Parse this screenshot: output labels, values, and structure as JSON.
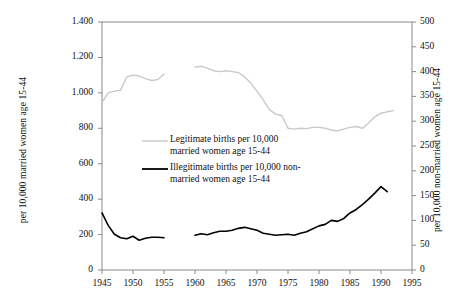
{
  "chart_data": {
    "type": "line",
    "title": "",
    "xlabel": "",
    "ylabel": "per 10,000 married women age 15-44",
    "ylabel_right": "per 10,000 non-married women age 15-44",
    "xlim": [
      1945,
      1995
    ],
    "ylim": [
      0,
      1400
    ],
    "ylim_right": [
      0,
      500
    ],
    "grid": false,
    "legend_position": "inside-center-left",
    "xticks": [
      1945,
      1950,
      1955,
      1960,
      1965,
      1970,
      1975,
      1980,
      1985,
      1990,
      1995
    ],
    "xtick_labels": [
      "1945",
      "1950",
      "1955",
      "1960",
      "1965",
      "1970",
      "1975",
      "1980",
      "1985",
      "1990",
      "1995"
    ],
    "yticks_left": [
      0,
      200,
      400,
      600,
      800,
      1000,
      1200,
      1400
    ],
    "ytick_labels_left": [
      "0",
      "200",
      "400",
      "600",
      "800",
      "1.000",
      "1.200",
      "1.400"
    ],
    "yticks_right": [
      0,
      50,
      100,
      150,
      200,
      250,
      300,
      350,
      400,
      450,
      500
    ],
    "ytick_labels_right": [
      "0",
      "50",
      "100",
      "150",
      "200",
      "250",
      "300",
      "350",
      "400",
      "450",
      "500"
    ],
    "series": [
      {
        "name": "Legitimate births per 10,000 married women age 15-44",
        "axis": "left",
        "color": "#c9c9c9",
        "width": 1.4,
        "segments": [
          {
            "x": [
              1945,
              1946,
              1947,
              1948,
              1949,
              1950,
              1951,
              1952,
              1953,
              1954,
              1955
            ],
            "y": [
              945,
              1000,
              1010,
              1015,
              1090,
              1100,
              1095,
              1080,
              1070,
              1075,
              1105
            ]
          },
          {
            "x": [
              1960,
              1961,
              1962,
              1963,
              1964,
              1965,
              1966,
              1967,
              1968,
              1969,
              1970,
              1971,
              1972,
              1973,
              1974,
              1975,
              1976,
              1977,
              1978,
              1979,
              1980,
              1981,
              1982,
              1983,
              1984,
              1985,
              1986,
              1987,
              1988,
              1989,
              1990,
              1991,
              1992
            ],
            "y": [
              1145,
              1150,
              1140,
              1125,
              1120,
              1125,
              1120,
              1115,
              1090,
              1055,
              1010,
              960,
              905,
              880,
              872,
              800,
              795,
              800,
              798,
              805,
              805,
              800,
              790,
              785,
              795,
              805,
              810,
              800,
              830,
              865,
              885,
              893,
              900
            ]
          }
        ]
      },
      {
        "name": "Illegitimate births per 10,000 non-married women age 15-44",
        "axis": "right",
        "color": "#000000",
        "width": 1.6,
        "segments": [
          {
            "x": [
              1945,
              1946,
              1947,
              1948,
              1949,
              1950,
              1951,
              1952,
              1953,
              1954,
              1955
            ],
            "y": [
              115,
              90,
              72,
              65,
              63,
              68,
              60,
              64,
              66,
              66,
              65
            ]
          },
          {
            "x": [
              1960,
              1961,
              1962,
              1963,
              1964,
              1965,
              1966,
              1967,
              1968,
              1969,
              1970,
              1971,
              1972,
              1973,
              1974,
              1975,
              1976,
              1977,
              1978,
              1979,
              1980,
              1981,
              1982,
              1983,
              1984,
              1985,
              1986,
              1987,
              1988,
              1989,
              1990,
              1991
            ],
            "y": [
              70,
              73,
              71,
              75,
              78,
              78,
              80,
              84,
              86,
              83,
              80,
              74,
              72,
              70,
              71,
              72,
              70,
              74,
              77,
              83,
              89,
              92,
              100,
              98,
              104,
              115,
              122,
              132,
              143,
              155,
              168,
              158
            ]
          }
        ]
      }
    ]
  },
  "legend": {
    "entries": [
      {
        "color": "#c9c9c9",
        "line1": "Legitimate births per 10,000",
        "line2": "married women age 15-44"
      },
      {
        "color": "#000000",
        "line1": "Illegitimate births per 10,000 non-",
        "line2": "married women age 15-44"
      }
    ]
  }
}
